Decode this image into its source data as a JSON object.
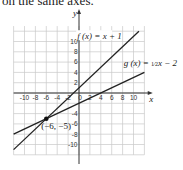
{
  "caption": "on the same axes.",
  "chart_data": {
    "type": "line",
    "title": "",
    "xlabel": "x",
    "ylabel": "y",
    "xlim": [
      -12,
      12
    ],
    "ylim": [
      -12,
      13
    ],
    "grid": true,
    "x_ticks": [
      "-10",
      "-8",
      "-6",
      "-4",
      "-2",
      "0",
      "2",
      "4",
      "6",
      "8",
      "10"
    ],
    "y_ticks": [
      "10",
      "8",
      "6",
      "4",
      "2",
      "-4",
      "-6",
      "-8",
      "-10"
    ],
    "series": [
      {
        "name": "f(x) = x + 1",
        "equation": "y = x + 1",
        "x": [
          -12,
          11
        ],
        "y": [
          -11,
          12
        ]
      },
      {
        "name": "g(x) = ½x − 2",
        "equation": "y = 0.5x - 2",
        "x": [
          -12,
          12
        ],
        "y": [
          -8,
          4
        ]
      }
    ],
    "annotations": [
      {
        "text": "(−6, −5)",
        "x": -6,
        "y": -5,
        "type": "intersection-point"
      },
      {
        "text": "f(x) = x + 1",
        "x": -1,
        "y": 11
      },
      {
        "text": "g(x) = ½x − 2",
        "x": 9,
        "y": 4.5
      }
    ]
  },
  "labels": {
    "f_label": "f (x) = x + 1",
    "g_label_prefix": "g (x) = ",
    "g_label_frac_num": "1",
    "g_label_frac_den": "2",
    "g_label_suffix": "x − 2",
    "intersection": "(−6, −5)",
    "x_axis": "x",
    "y_axis": "y"
  }
}
